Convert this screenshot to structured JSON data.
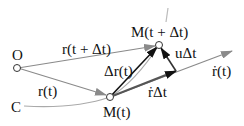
{
  "diagram": {
    "points": {
      "origin": {
        "label": "O"
      },
      "curve_start": {
        "label": "C"
      },
      "m_t": {
        "label": "M(t)"
      },
      "m_t_dt": {
        "label": "M(t + Δt)"
      }
    },
    "vectors": {
      "r_t": {
        "label": "r(t)"
      },
      "r_t_dt": {
        "label": "r(t + Δt)"
      },
      "delta_r": {
        "label": "Δr(t)"
      },
      "rdot_dt": {
        "label": "ṙΔt"
      },
      "u_dt": {
        "label": "uΔt"
      },
      "rdot": {
        "label": "ṙ(t)"
      }
    },
    "colors": {
      "black_vector": "#111111",
      "gray_vector": "#8a8a8a",
      "curve": "#9a9a9a"
    }
  }
}
